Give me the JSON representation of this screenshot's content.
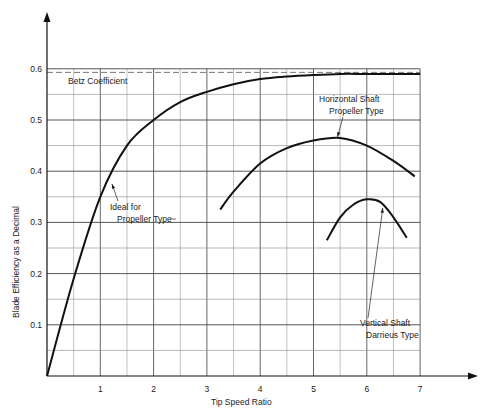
{
  "chart_data": {
    "type": "line",
    "title": "",
    "xlabel": "Tip Speed Ratio",
    "ylabel": "Blade Efficiency as a Decimal",
    "xlim": [
      0,
      7.5
    ],
    "ylim": [
      0,
      0.65
    ],
    "x_ticks": [
      "1",
      "2",
      "3",
      "4",
      "5",
      "6",
      "7"
    ],
    "y_ticks": [
      "0.1",
      "0.2",
      "0.3",
      "0.4",
      "0.5",
      "0.6"
    ],
    "grid": true,
    "reference_line": {
      "name": "Betz Coefficient",
      "y": 0.593,
      "style": "dashed"
    },
    "series": [
      {
        "name": "Ideal for Propeller Type",
        "x": [
          0,
          0.5,
          1,
          1.5,
          2,
          2.5,
          3,
          3.5,
          4,
          4.5,
          5,
          5.5,
          6,
          6.5,
          7
        ],
        "y": [
          0,
          0.19,
          0.35,
          0.45,
          0.5,
          0.535,
          0.555,
          0.57,
          0.58,
          0.585,
          0.588,
          0.59,
          0.59,
          0.59,
          0.59
        ]
      },
      {
        "name": "Horizontal Shaft Propeller Type",
        "x": [
          3.25,
          3.5,
          4,
          4.5,
          5,
          5.5,
          6,
          6.5,
          6.9
        ],
        "y": [
          0.325,
          0.36,
          0.415,
          0.445,
          0.46,
          0.465,
          0.45,
          0.42,
          0.39
        ]
      },
      {
        "name": "Vertical Shaft Darrieus Type",
        "x": [
          5.25,
          5.5,
          5.75,
          6,
          6.25,
          6.5,
          6.75
        ],
        "y": [
          0.265,
          0.31,
          0.335,
          0.345,
          0.34,
          0.31,
          0.27
        ]
      }
    ],
    "annotations": [
      {
        "text": [
          "Betz Coefficient"
        ],
        "near": "top-left under dashed line"
      },
      {
        "text": [
          "Ideal for",
          "Propeller Type"
        ],
        "arrow_to": [
          1.2,
          0.375
        ]
      },
      {
        "text": [
          "Horizontal Shaft",
          "Propeller Type"
        ],
        "arrow_to": [
          5.45,
          0.465
        ]
      },
      {
        "text": [
          "Vertical Shaft",
          "Darrieus Type"
        ],
        "arrow_to": [
          6.3,
          0.33
        ]
      }
    ]
  },
  "labels": {
    "x_axis": "Tip Speed Ratio",
    "y_axis": "Blade Efficiency as a Decimal",
    "betz": "Betz Coefficient",
    "ideal_1": "Ideal for",
    "ideal_2": "Propeller Type",
    "horiz_1": "Horizontal Shaft",
    "horiz_2": "Propeller Type",
    "vert_1": "Vertical Shaft",
    "vert_2": "Darrieus Type"
  }
}
